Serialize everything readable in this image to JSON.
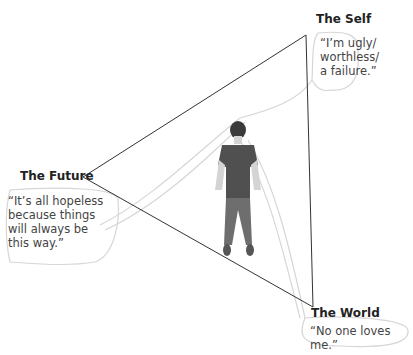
{
  "diagram": {
    "type": "cognitive-triad",
    "nodes": [
      {
        "id": "self",
        "label": "The Self",
        "quote": "“I’m ugly/ worthless/ a failure.”",
        "quote_lines": [
          "“I’m ugly/",
          "worthless/",
          "a failure.”"
        ]
      },
      {
        "id": "future",
        "label": "The Future",
        "quote": "“It’s all hopeless because things will always be this way.”",
        "quote_lines": [
          "“It’s all hopeless",
          "because things",
          "will always be",
          "this way.”"
        ]
      },
      {
        "id": "world",
        "label": "The World",
        "quote": "“No one loves me.”",
        "quote_lines": [
          "“No one loves me.”"
        ]
      }
    ],
    "center_figure": "standing-woman-illustration",
    "colors": {
      "line": "#333333",
      "bubble": "#d9d9d9",
      "figure": "#6e6e6e",
      "shirt": "#4f4f4f"
    }
  }
}
